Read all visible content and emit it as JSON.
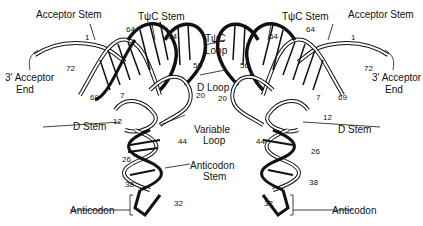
{
  "labels": {
    "acceptor_stem": "Acceptor Stem",
    "tpsic_stem": "TψC Stem",
    "tpsic_loop_1": "TψC",
    "tpsic_loop_2": "Loop",
    "acceptor_end_1": "3' Acceptor",
    "acceptor_end_2": "End",
    "d_loop": "D Loop",
    "d_stem": "D Stem",
    "variable_1": "Variable",
    "variable_2": "Loop",
    "anticodon_stem_1": "Anticodon",
    "anticodon_stem_2": "Stem",
    "anticodon": "Anticodon"
  },
  "numbers": {
    "n1": "1",
    "n7": "7",
    "n12": "12",
    "n20": "20",
    "n26": "26",
    "n32": "32",
    "n38": "38",
    "n44": "44",
    "n54": "54",
    "n56": "56",
    "n64": "64",
    "n69": "69",
    "n72": "72"
  }
}
